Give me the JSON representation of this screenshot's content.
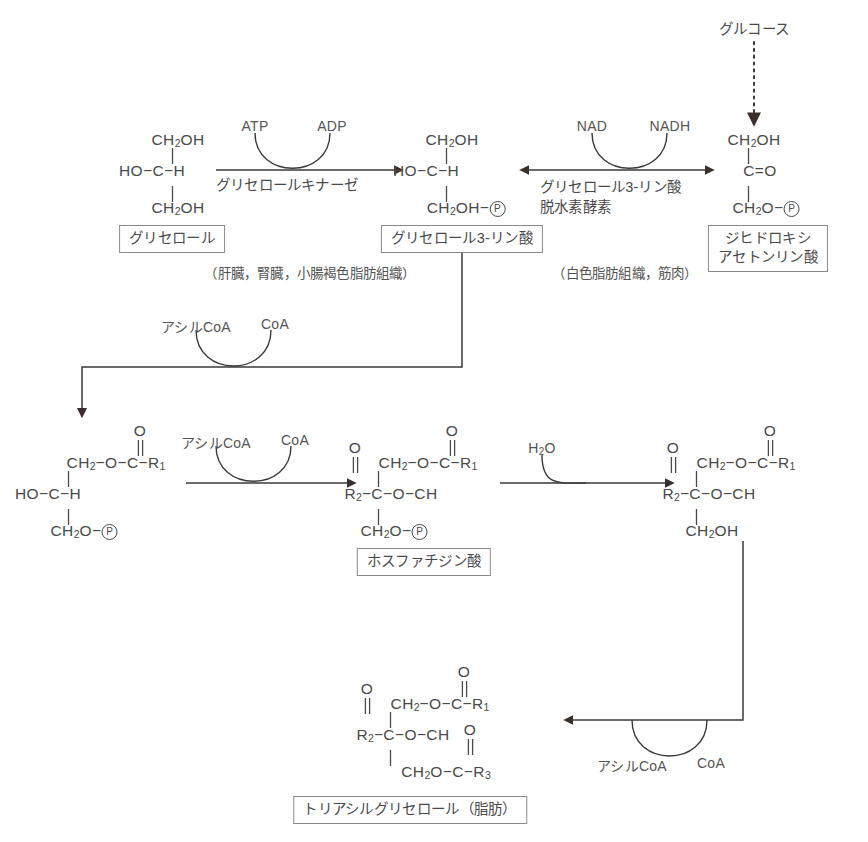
{
  "diagram": {
    "colors": {
      "stroke": "#3a3a3a",
      "arrowhead": "#3b2f2b",
      "text": "#4a4a4a",
      "box_border": "#8a8a8a",
      "background": "#ffffff"
    }
  },
  "nodes": {
    "glucose": {
      "label": "グルコース"
    },
    "glycerol": {
      "box_label": "グリセロール",
      "tissue": "（肝臓，腎臓，小腸褐色脂肪組織）",
      "structure": {
        "top": "CH2OH",
        "middle": "HO−C−H",
        "bottom": "CH2OH"
      }
    },
    "glycerol_3_phosphate": {
      "box_label": "グリセロール3-リン酸",
      "tissue": "（白色脂肪組織，筋肉）",
      "structure": {
        "top": "CH2OH",
        "middle": "HO−C−H",
        "bottom": "CH2OH−Ⓟ"
      }
    },
    "dhap": {
      "box_label": "ジヒドロキシ\nアセトンリン酸",
      "box_line1": "ジヒドロキシ",
      "box_line2": "アセトンリン酸",
      "structure": {
        "top": "CH2OH",
        "middle": "C=O",
        "bottom": "CH2O−Ⓟ"
      }
    },
    "lysophosphatidic_acid": {
      "structure": {
        "carbonyl_o": "O",
        "top": "CH2−O−C−R1",
        "middle": "HO−C−H",
        "bottom": "CH2O−Ⓟ"
      }
    },
    "phosphatidic_acid": {
      "box_label": "ホスファチジン酸",
      "structure": {
        "carbonyl_o_right": "O",
        "carbonyl_o_left": "O",
        "top": "CH2−O−C−R1",
        "middle": "R2−C−O−CH",
        "bottom": "CH2O−Ⓟ"
      }
    },
    "diacylglycerol": {
      "structure": {
        "carbonyl_o_right": "O",
        "carbonyl_o_left": "O",
        "top": "CH2−O−C−R1",
        "middle": "R2−C−O−CH",
        "bottom": "CH2OH"
      }
    },
    "triacylglycerol": {
      "box_label": "トリアシルグリセロール（脂肪）",
      "structure": {
        "carbonyl_o_right": "O",
        "carbonyl_o_left": "O",
        "carbonyl_o_bottom": "O",
        "top": "CH2−O−C−R1",
        "middle": "R2−C−O−CH",
        "bottom": "CH2O−C−R3"
      }
    }
  },
  "reactions": {
    "glycerol_kinase": {
      "enzyme": "グリセロールキナーゼ",
      "substrate": "ATP",
      "product": "ADP"
    },
    "g3p_dehydrogenase": {
      "enzyme_line1": "グリセロール3-リン酸",
      "enzyme_line2": "脱水素酵素",
      "substrate": "NAD",
      "product": "NADH",
      "reversible": true
    },
    "acyltransferase_1": {
      "substrate": "アシルCoA",
      "product": "CoA"
    },
    "acyltransferase_2": {
      "substrate": "アシルCoA",
      "product": "CoA"
    },
    "phosphatase": {
      "substrate": "H2O"
    },
    "acyltransferase_3": {
      "substrate": "アシルCoA",
      "product": "CoA"
    }
  }
}
